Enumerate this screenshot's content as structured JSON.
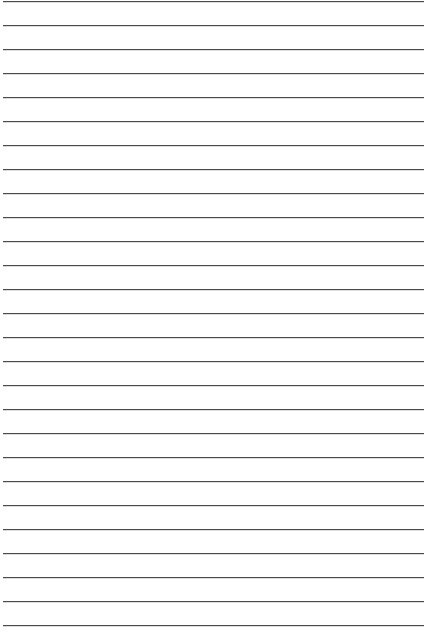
{
  "page": {
    "type": "lined-paper",
    "background": "#ffffff",
    "line_color": "#4a4a4a",
    "line_count": 27,
    "first_line_y": 1,
    "line_spacing": 24,
    "line_left": 3,
    "line_right": 424
  }
}
